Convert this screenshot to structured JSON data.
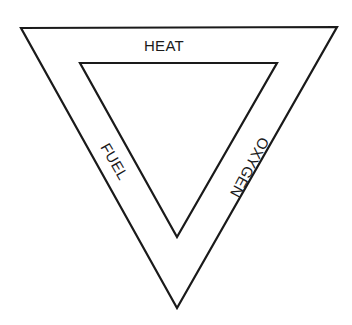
{
  "diagram": {
    "type": "fire-triangle",
    "stroke_color": "#1a1a1a",
    "background": "#ffffff",
    "outer_triangle": [
      [
        21,
        28
      ],
      [
        337,
        27
      ],
      [
        177,
        308
      ]
    ],
    "inner_triangle": [
      [
        80,
        63
      ],
      [
        277,
        63
      ],
      [
        177,
        237
      ]
    ],
    "sides": {
      "top": {
        "label": "HEAT"
      },
      "left": {
        "label": "FUEL"
      },
      "right": {
        "label": "OXYGEN"
      }
    }
  }
}
